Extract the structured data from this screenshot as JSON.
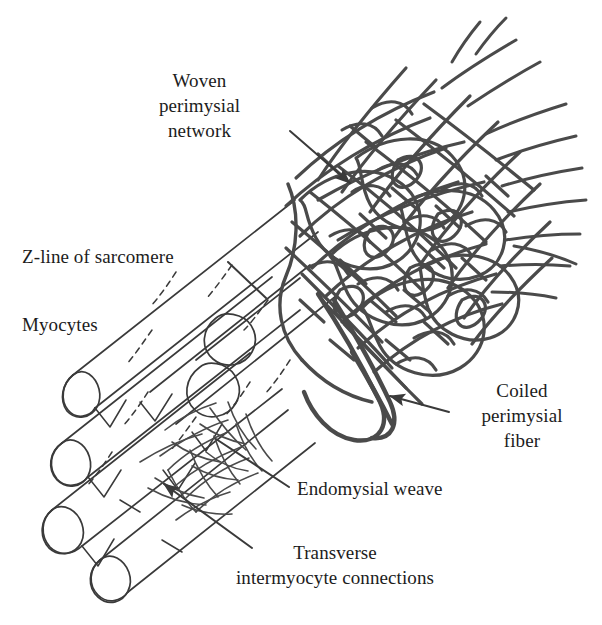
{
  "figure": {
    "type": "anatomical-diagram",
    "background_color": "#ffffff",
    "ink_color": "#4a4a4a",
    "outline_color": "#3a3a3a",
    "text_color": "#1c1c1c"
  },
  "labels": [
    {
      "id": "woven-perimysial-network",
      "text": "Woven\nperimysial\nnetwork",
      "align": "center",
      "x": 112,
      "y": 68,
      "width": 175,
      "leader": {
        "type": "arrow",
        "from": [
          290,
          131
        ],
        "to": [
          353,
          186
        ]
      }
    },
    {
      "id": "z-line-of-sarcomere",
      "text": "Z-line of sarcomere",
      "align": "left",
      "x": 22,
      "y": 244,
      "width": 210,
      "leader": {
        "type": "dashed",
        "from": [
          228,
          262
        ],
        "to": [
          268,
          300
        ]
      }
    },
    {
      "id": "myocytes",
      "text": "Myocytes",
      "align": "left",
      "x": 22,
      "y": 312,
      "width": 130,
      "leader": {
        "type": "none"
      }
    },
    {
      "id": "coiled-perimysial-fiber",
      "text": "Coiled\nperimysial\nfiber",
      "align": "center",
      "x": 452,
      "y": 378,
      "width": 140,
      "leader": {
        "type": "arrow",
        "from": [
          449,
          412
        ],
        "to": [
          385,
          395
        ]
      }
    },
    {
      "id": "endomysial-weave",
      "text": "Endomysial weave",
      "align": "left",
      "x": 297,
      "y": 476,
      "width": 200,
      "leader": {
        "type": "line",
        "from": [
          289,
          487
        ],
        "to": [
          213,
          437
        ]
      }
    },
    {
      "id": "transverse-intermyocyte-connections",
      "text": "Transverse\nintermyocyte connections",
      "align": "center",
      "x": 185,
      "y": 540,
      "width": 295,
      "leader": {
        "type": "arrow",
        "from": [
          252,
          548
        ],
        "to": [
          160,
          482
        ]
      }
    }
  ],
  "structures": {
    "myocyte_count": 6,
    "myocyte_axis_degrees": -38,
    "z_line_style": "dashed",
    "network_region": "upper-right bundle sheath",
    "endomysial_region": "between myocytes, lower-middle",
    "frayed_fiber_ends": 9
  }
}
